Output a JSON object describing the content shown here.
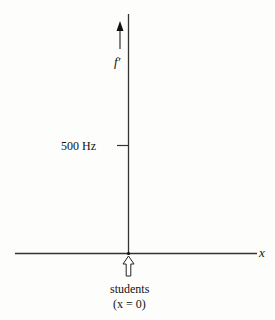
{
  "diagram": {
    "axes": {
      "vertical_label": "f′",
      "horizontal_label": "x",
      "tick_label": "500 Hz"
    },
    "marker": {
      "label_line1": "students",
      "label_line2": "(x = 0)"
    },
    "colors": {
      "line": "#333333",
      "background": "#fdfdfc"
    }
  }
}
